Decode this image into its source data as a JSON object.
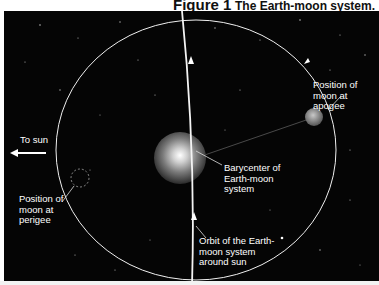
{
  "figure": {
    "number_label": "Figure 1",
    "title": "The Earth-moon system."
  },
  "labels": {
    "to_sun": "To sun",
    "perigee": [
      "Position of",
      "moon at",
      "perigee"
    ],
    "apogee": [
      "Position of",
      "moon at",
      "apogee"
    ],
    "barycenter": [
      "Barycenter of",
      "Earth-moon",
      "system"
    ],
    "orbit": [
      "Orbit of the Earth-",
      "moon system",
      "around sun"
    ]
  },
  "colors": {
    "background": "#050505",
    "lines": "#f0f0f0",
    "text": "#ffffff"
  },
  "icons": {
    "to_sun_arrow": "arrow-left-icon",
    "orbit_direction_arrow": "arrow-up-icon"
  }
}
